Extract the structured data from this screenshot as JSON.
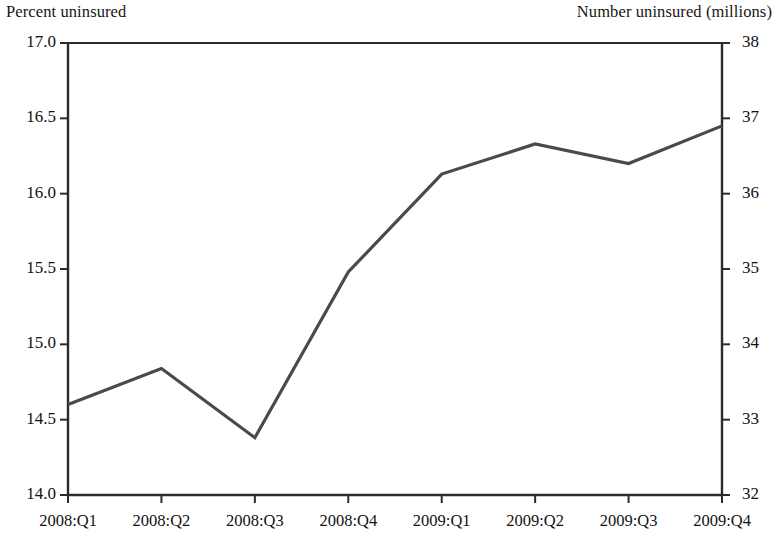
{
  "chart_data": {
    "type": "line",
    "title": "",
    "subtitle": "",
    "xlabel": "",
    "ylabel": "Percent uninsured",
    "y2label": "Number uninsured (millions)",
    "categories": [
      "2008:Q1",
      "2008:Q2",
      "2008:Q3",
      "2008:Q4",
      "2009:Q1",
      "2009:Q2",
      "2009:Q3",
      "2009:Q4"
    ],
    "series": [
      {
        "name": "Percent uninsured",
        "values": [
          14.6,
          14.84,
          14.38,
          15.48,
          16.13,
          16.33,
          16.2,
          16.45
        ],
        "color": "#4a4a4a"
      }
    ],
    "secondary_values_millions": [
      33.3,
      33.8,
      32.9,
      35.1,
      36.7,
      37.1,
      36.9,
      37.4
    ],
    "ylim": [
      14.0,
      17.0
    ],
    "yticks": [
      "14.0",
      "14.5",
      "15.0",
      "15.5",
      "16.0",
      "16.5",
      "17.0"
    ],
    "ytickvalues": [
      14.0,
      14.5,
      15.0,
      15.5,
      16.0,
      16.5,
      17.0
    ],
    "y2lim": [
      32,
      38
    ],
    "y2ticks": [
      "32",
      "33",
      "34",
      "35",
      "36",
      "37",
      "38"
    ],
    "y2tickvalues": [
      32,
      33,
      34,
      35,
      36,
      37,
      38
    ],
    "grid": false,
    "legend": "none",
    "line_color": "#4a4a4a",
    "axis_color": "#2b2b2b",
    "background": "#ffffff"
  },
  "captions": {
    "left": "Percent uninsured",
    "right": "Number uninsured (millions)"
  },
  "y_axis_left": {
    "labels": [
      "17.0",
      "16.5",
      "16.0",
      "15.5",
      "15.0",
      "14.5",
      "14.0"
    ]
  },
  "y_axis_right": {
    "labels": [
      "38",
      "37",
      "36",
      "35",
      "34",
      "33",
      "32"
    ]
  },
  "x_axis": {
    "labels": [
      "2008:Q1",
      "2008:Q2",
      "2008:Q3",
      "2008:Q4",
      "2009:Q1",
      "2009:Q2",
      "2009:Q3",
      "2009:Q4"
    ]
  }
}
